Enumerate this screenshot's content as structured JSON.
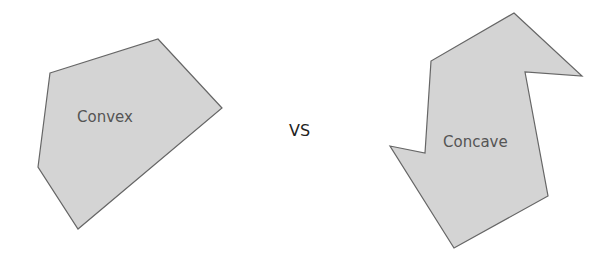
{
  "diagram": {
    "convex": {
      "label": "Convex",
      "points": "50,73 158,39 222,108 78,229 38,167",
      "fill": "#d4d4d4",
      "stroke": "#666666"
    },
    "separator": "VS",
    "concave": {
      "label": "Concave",
      "points": "514,13 582,76 525,72 548,196 454,248 390,146 425,153 431,61",
      "fill": "#d4d4d4",
      "stroke": "#666666"
    }
  }
}
